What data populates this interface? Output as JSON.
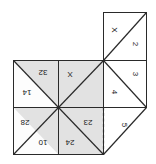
{
  "figure": {
    "kind": "fortune-teller-net",
    "background_color": "#ffffff",
    "line_color": "#1a1a1a",
    "shaded_fill": "#e0e0e0",
    "plain_fill": "#ffffff"
  },
  "panels": [
    {
      "id": "top-right-square",
      "shaded": false,
      "diagonal": "bl-tr",
      "labels": [
        {
          "id": "tr-x",
          "text": "X",
          "rotation": 90
        },
        {
          "id": "tr-2",
          "text": "2",
          "rotation": 90
        }
      ]
    },
    {
      "id": "right-upper-square",
      "shaded": false,
      "diagonal": "tl-br",
      "labels": [
        {
          "id": "r-3",
          "text": "3",
          "rotation": 90
        },
        {
          "id": "r-4",
          "text": "4",
          "rotation": 90
        }
      ]
    },
    {
      "id": "right-lower-square",
      "shaded": false,
      "diagonal": "tr-bl-triangle",
      "labels": [
        {
          "id": "r-5",
          "text": "5",
          "rotation": 90
        }
      ]
    },
    {
      "id": "grid-top-left",
      "shaded": true,
      "diagonal": "tl-br",
      "labels": [
        {
          "id": "g-32",
          "text": "32",
          "rotation": 180
        },
        {
          "id": "g-14",
          "text": "14",
          "rotation": 180
        }
      ]
    },
    {
      "id": "grid-top-right",
      "shaded": true,
      "diagonal": "bl-tr",
      "labels": [
        {
          "id": "g-x",
          "text": "X",
          "rotation": 180
        }
      ]
    },
    {
      "id": "grid-bottom-left",
      "shaded": true,
      "diagonal": "bl-tr",
      "labels": [
        {
          "id": "g-28",
          "text": "28",
          "rotation": 180
        },
        {
          "id": "g-10",
          "text": "10",
          "rotation": 180
        }
      ]
    },
    {
      "id": "grid-bottom-right",
      "shaded": true,
      "diagonal": "tl-br",
      "labels": [
        {
          "id": "g-23",
          "text": "23",
          "rotation": 180
        },
        {
          "id": "g-24",
          "text": "24",
          "rotation": 180
        }
      ]
    }
  ],
  "labels": {
    "tr_x": "X",
    "tr_2": "2",
    "r_3": "3",
    "r_4": "4",
    "r_5": "5",
    "g_32": "32",
    "g_14": "14",
    "g_x": "X",
    "g_28": "28",
    "g_10": "10",
    "g_23": "23",
    "g_24": "24"
  }
}
